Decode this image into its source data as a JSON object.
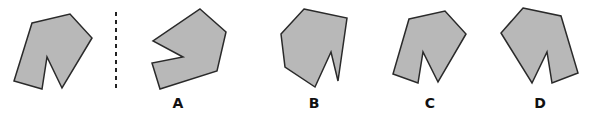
{
  "figure": {
    "fill_color": "#b8b8b8",
    "stroke_color": "#2a2a2a",
    "divider": {
      "x": 116,
      "y1": 12,
      "y2": 88,
      "style": "dashed"
    },
    "original": {
      "points": "32,23 70,14 92,38 62,88 47,57 42,89 14,81"
    },
    "options": [
      {
        "label": "A",
        "points": "200,9 226,32 217,71 160,89 152,63 183,57 153,41",
        "label_x": 178,
        "label_y": 95
      },
      {
        "label": "B",
        "points": "304,9 347,18 338,81 331,52 315,87 285,67 281,34",
        "label_x": 314,
        "label_y": 95
      },
      {
        "label": "C",
        "points": "409,19 445,11 466,34 438,82 423,52 418,83 393,74",
        "label_x": 430,
        "label_y": 95
      },
      {
        "label": "D",
        "points": "523,8 561,16 578,73 552,83 547,52 532,83 501,33",
        "label_x": 540,
        "label_y": 95
      }
    ]
  }
}
